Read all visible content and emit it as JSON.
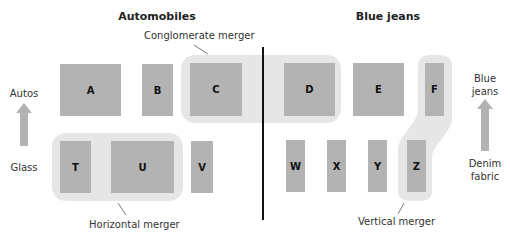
{
  "titles": {
    "left_industry": "Automobiles",
    "right_industry": "Blue jeans"
  },
  "merger_labels": {
    "conglomerate": "Conglomerate merger",
    "horizontal": "Horizontal merger",
    "vertical": "Vertical merger"
  },
  "axis_labels": {
    "left_top": "Autos",
    "left_bottom": "Glass",
    "right_top_line1": "Blue",
    "right_top_line2": "jeans",
    "right_bottom_line1": "Denim",
    "right_bottom_line2": "fabric"
  },
  "firms": {
    "automobiles_top": [
      "A",
      "B",
      "C"
    ],
    "bluejeans_top": [
      "D",
      "E",
      "F"
    ],
    "automobiles_bottom": [
      "T",
      "U",
      "V"
    ],
    "bluejeans_bottom": [
      "W",
      "X",
      "Y",
      "Z"
    ]
  },
  "colors": {
    "firm_box": "#b3b3b3",
    "merger_highlight": "#e6e6e6",
    "arrow": "#b3b3b3",
    "divider": "#111111"
  }
}
